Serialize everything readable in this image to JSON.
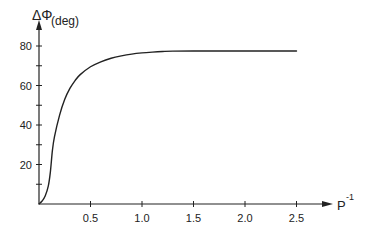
{
  "chart_data": {
    "type": "line",
    "title": "",
    "xlabel": "P^-1",
    "xlabel_base": "P",
    "xlabel_sup": "-1",
    "ylabel": "ΔΦ(deg)",
    "ylabel_symbol": "ΔΦ",
    "ylabel_unit": "(deg)",
    "xlim": [
      0,
      2.5
    ],
    "ylim": [
      0,
      80
    ],
    "x_ticks": [
      0.5,
      1.0,
      1.5,
      2.0,
      2.5
    ],
    "x_tick_labels": [
      "0.5",
      "1.0",
      "1.5",
      "2.0",
      "2.5"
    ],
    "x_minor_ticks": [],
    "y_ticks": [
      20,
      40,
      60,
      80
    ],
    "y_tick_labels": [
      "20",
      "40",
      "60",
      "80"
    ],
    "y_minor_ticks": [
      10,
      30,
      50,
      70
    ],
    "grid": false,
    "legend": null,
    "series": [
      {
        "name": "ΔΦ",
        "x": [
          0.0,
          0.03,
          0.06,
          0.09,
          0.11,
          0.13,
          0.15,
          0.2,
          0.25,
          0.3,
          0.35,
          0.4,
          0.5,
          0.6,
          0.7,
          0.8,
          0.9,
          1.0,
          1.1,
          1.2,
          1.3,
          1.5,
          1.75,
          2.0,
          2.25,
          2.5
        ],
        "y": [
          0.0,
          1.5,
          4.0,
          9.0,
          16.0,
          27.0,
          34.0,
          45.0,
          53.0,
          58.5,
          62.5,
          65.5,
          69.5,
          72.0,
          73.8,
          75.0,
          75.9,
          76.5,
          76.9,
          77.2,
          77.4,
          77.5,
          77.5,
          77.5,
          77.5,
          77.5
        ]
      }
    ]
  }
}
